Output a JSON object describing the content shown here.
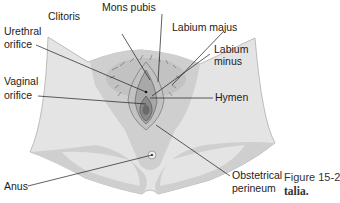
{
  "figure": {
    "number_label": "Figure 15-2",
    "caption_fragment": "talia."
  },
  "labels": {
    "clitoris": "Clitoris",
    "mons_pubis": "Mons pubis",
    "urethral_orifice_1": "Urethral",
    "urethral_orifice_2": "orifice",
    "labium_majus": "Labium majus",
    "labium_minus_1": "Labium",
    "labium_minus_2": "minus",
    "vaginal_orifice_1": "Vaginal",
    "vaginal_orifice_2": "orifice",
    "hymen": "Hymen",
    "anus": "Anus",
    "obstetrical_perineum_1": "Obstetrical",
    "obstetrical_perineum_2": "perineum"
  },
  "colors": {
    "skin_light": "#e4e4e4",
    "skin_mid": "#cfcfcf",
    "skin_dark": "#9a9a9a",
    "line": "#1c1c1c"
  }
}
